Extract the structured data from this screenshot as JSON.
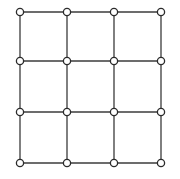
{
  "figure": {
    "width": 180,
    "height": 179,
    "background_color": "#ffffff"
  },
  "style": {
    "edge_color": "#3b3b3b",
    "edge_width": 1.3,
    "node_fill": "#ffffff",
    "node_stroke": "#2b2b2b",
    "node_stroke_width": 1.3,
    "node_radius": 3.6
  },
  "chart_data": {
    "type": "scatter",
    "xlabel": "",
    "ylabel": "",
    "xlim": [
      0,
      180
    ],
    "ylim": [
      0,
      179
    ],
    "grid": false,
    "legend": "none",
    "rows": 4,
    "columns": 4,
    "node_count": 16,
    "edge_count": 24,
    "cell_count": 9,
    "column_x": [
      20,
      67,
      114,
      161
    ],
    "row_y": [
      12,
      61,
      112,
      163
    ],
    "nodes": [
      {
        "id": "n0-0",
        "row": 0,
        "col": 0,
        "x": 20,
        "y": 12
      },
      {
        "id": "n0-1",
        "row": 0,
        "col": 1,
        "x": 67,
        "y": 12
      },
      {
        "id": "n0-2",
        "row": 0,
        "col": 2,
        "x": 114,
        "y": 12
      },
      {
        "id": "n0-3",
        "row": 0,
        "col": 3,
        "x": 161,
        "y": 12
      },
      {
        "id": "n1-0",
        "row": 1,
        "col": 0,
        "x": 20,
        "y": 61
      },
      {
        "id": "n1-1",
        "row": 1,
        "col": 1,
        "x": 67,
        "y": 61
      },
      {
        "id": "n1-2",
        "row": 1,
        "col": 2,
        "x": 114,
        "y": 61
      },
      {
        "id": "n1-3",
        "row": 1,
        "col": 3,
        "x": 161,
        "y": 61
      },
      {
        "id": "n2-0",
        "row": 2,
        "col": 0,
        "x": 20,
        "y": 112
      },
      {
        "id": "n2-1",
        "row": 2,
        "col": 1,
        "x": 67,
        "y": 112
      },
      {
        "id": "n2-2",
        "row": 2,
        "col": 2,
        "x": 114,
        "y": 112
      },
      {
        "id": "n2-3",
        "row": 2,
        "col": 3,
        "x": 161,
        "y": 112
      },
      {
        "id": "n3-0",
        "row": 3,
        "col": 0,
        "x": 20,
        "y": 163
      },
      {
        "id": "n3-1",
        "row": 3,
        "col": 1,
        "x": 67,
        "y": 163
      },
      {
        "id": "n3-2",
        "row": 3,
        "col": 2,
        "x": 114,
        "y": 163
      },
      {
        "id": "n3-3",
        "row": 3,
        "col": 3,
        "x": 161,
        "y": 163
      }
    ],
    "edges": [
      {
        "from": "n0-0",
        "to": "n0-1",
        "orientation": "horizontal"
      },
      {
        "from": "n0-1",
        "to": "n0-2",
        "orientation": "horizontal"
      },
      {
        "from": "n0-2",
        "to": "n0-3",
        "orientation": "horizontal"
      },
      {
        "from": "n1-0",
        "to": "n1-1",
        "orientation": "horizontal"
      },
      {
        "from": "n1-1",
        "to": "n1-2",
        "orientation": "horizontal"
      },
      {
        "from": "n1-2",
        "to": "n1-3",
        "orientation": "horizontal"
      },
      {
        "from": "n2-0",
        "to": "n2-1",
        "orientation": "horizontal"
      },
      {
        "from": "n2-1",
        "to": "n2-2",
        "orientation": "horizontal"
      },
      {
        "from": "n2-2",
        "to": "n2-3",
        "orientation": "horizontal"
      },
      {
        "from": "n3-0",
        "to": "n3-1",
        "orientation": "horizontal"
      },
      {
        "from": "n3-1",
        "to": "n3-2",
        "orientation": "horizontal"
      },
      {
        "from": "n3-2",
        "to": "n3-3",
        "orientation": "horizontal"
      },
      {
        "from": "n0-0",
        "to": "n1-0",
        "orientation": "vertical"
      },
      {
        "from": "n1-0",
        "to": "n2-0",
        "orientation": "vertical"
      },
      {
        "from": "n2-0",
        "to": "n3-0",
        "orientation": "vertical"
      },
      {
        "from": "n0-1",
        "to": "n1-1",
        "orientation": "vertical"
      },
      {
        "from": "n1-1",
        "to": "n2-1",
        "orientation": "vertical"
      },
      {
        "from": "n2-1",
        "to": "n3-1",
        "orientation": "vertical"
      },
      {
        "from": "n0-2",
        "to": "n1-2",
        "orientation": "vertical"
      },
      {
        "from": "n1-2",
        "to": "n2-2",
        "orientation": "vertical"
      },
      {
        "from": "n2-2",
        "to": "n3-2",
        "orientation": "vertical"
      },
      {
        "from": "n0-3",
        "to": "n1-3",
        "orientation": "vertical"
      },
      {
        "from": "n1-3",
        "to": "n2-3",
        "orientation": "vertical"
      },
      {
        "from": "n2-3",
        "to": "n3-3",
        "orientation": "vertical"
      }
    ]
  }
}
